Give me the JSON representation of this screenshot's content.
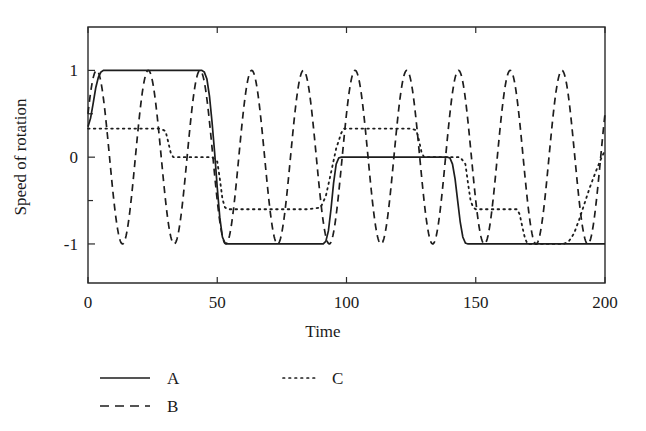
{
  "chart_data": {
    "type": "line",
    "title": "",
    "xlabel": "Time",
    "ylabel": "Speed of rotation",
    "xlim": [
      0,
      200
    ],
    "ylim": [
      -1.45,
      1.5
    ],
    "xticks": [
      0,
      50,
      100,
      150,
      200
    ],
    "xticklabels": [
      "0",
      "50",
      "100",
      "150",
      "200"
    ],
    "yticks": [
      -1,
      0,
      1
    ],
    "yticklabels": [
      "-1",
      "0",
      "1"
    ],
    "yminorticks": [
      -1.5,
      -0.5,
      0.5,
      1.5
    ],
    "grid": false,
    "frame": "box",
    "legend_position": "below-axes",
    "series": [
      {
        "name": "A",
        "style": "solid",
        "description": "smoothed square wave switching between 1, -1, 0 and -1",
        "points": [
          [
            0,
            0.35
          ],
          [
            1,
            0.45
          ],
          [
            2,
            0.62
          ],
          [
            3,
            0.8
          ],
          [
            4,
            0.92
          ],
          [
            5,
            0.98
          ],
          [
            6,
            1.0
          ],
          [
            10,
            1.0
          ],
          [
            20,
            1.0
          ],
          [
            30,
            1.0
          ],
          [
            40,
            1.0
          ],
          [
            44,
            1.0
          ],
          [
            45,
            0.98
          ],
          [
            46,
            0.9
          ],
          [
            47,
            0.7
          ],
          [
            48,
            0.4
          ],
          [
            49,
            0.05
          ],
          [
            50,
            -0.35
          ],
          [
            51,
            -0.7
          ],
          [
            52,
            -0.92
          ],
          [
            53,
            -0.99
          ],
          [
            54,
            -1.0
          ],
          [
            60,
            -1.0
          ],
          [
            70,
            -1.0
          ],
          [
            80,
            -1.0
          ],
          [
            90,
            -1.0
          ],
          [
            91,
            -1.0
          ],
          [
            92,
            -0.97
          ],
          [
            93,
            -0.85
          ],
          [
            94,
            -0.6
          ],
          [
            95,
            -0.3
          ],
          [
            96,
            -0.08
          ],
          [
            97,
            -0.01
          ],
          [
            98,
            0.0
          ],
          [
            100,
            0.0
          ],
          [
            110,
            0.0
          ],
          [
            120,
            0.0
          ],
          [
            130,
            0.0
          ],
          [
            139,
            0.0
          ],
          [
            140,
            -0.01
          ],
          [
            141,
            -0.08
          ],
          [
            142,
            -0.25
          ],
          [
            143,
            -0.5
          ],
          [
            144,
            -0.75
          ],
          [
            145,
            -0.92
          ],
          [
            146,
            -0.99
          ],
          [
            147,
            -1.0
          ],
          [
            150,
            -1.0
          ],
          [
            160,
            -1.0
          ],
          [
            170,
            -1.0
          ],
          [
            180,
            -1.0
          ],
          [
            190,
            -1.0
          ],
          [
            200,
            -1.0
          ]
        ]
      },
      {
        "name": "B",
        "style": "dashed",
        "description": "sinusoid, amplitude 1, period 20, phase rising through 0.5 at t=0",
        "amplitude": 1.0,
        "period": 20,
        "phase_at_t0": 0.5
      },
      {
        "name": "C",
        "style": "dotted",
        "description": "piecewise staircase with smooth ramps between plateaus",
        "points": [
          [
            0,
            0.33
          ],
          [
            10,
            0.33
          ],
          [
            20,
            0.33
          ],
          [
            28,
            0.33
          ],
          [
            30,
            0.3
          ],
          [
            31,
            0.18
          ],
          [
            32,
            0.05
          ],
          [
            33,
            0.0
          ],
          [
            40,
            0.0
          ],
          [
            48,
            0.0
          ],
          [
            50,
            -0.05
          ],
          [
            51,
            -0.25
          ],
          [
            52,
            -0.48
          ],
          [
            53,
            -0.58
          ],
          [
            54,
            -0.6
          ],
          [
            60,
            -0.6
          ],
          [
            70,
            -0.6
          ],
          [
            85,
            -0.6
          ],
          [
            90,
            -0.58
          ],
          [
            92,
            -0.45
          ],
          [
            94,
            -0.18
          ],
          [
            96,
            0.1
          ],
          [
            98,
            0.28
          ],
          [
            99,
            0.33
          ],
          [
            105,
            0.33
          ],
          [
            115,
            0.33
          ],
          [
            125,
            0.33
          ],
          [
            127,
            0.31
          ],
          [
            128,
            0.2
          ],
          [
            129,
            0.06
          ],
          [
            130,
            0.0
          ],
          [
            138,
            0.0
          ],
          [
            144,
            0.0
          ],
          [
            146,
            -0.08
          ],
          [
            147,
            -0.3
          ],
          [
            148,
            -0.5
          ],
          [
            149,
            -0.58
          ],
          [
            150,
            -0.6
          ],
          [
            158,
            -0.6
          ],
          [
            166,
            -0.6
          ],
          [
            167,
            -0.66
          ],
          [
            168,
            -0.8
          ],
          [
            169,
            -0.93
          ],
          [
            170,
            -1.0
          ],
          [
            176,
            -1.0
          ],
          [
            184,
            -1.0
          ],
          [
            186,
            -0.97
          ],
          [
            188,
            -0.88
          ],
          [
            190,
            -0.72
          ],
          [
            192,
            -0.54
          ],
          [
            194,
            -0.36
          ],
          [
            196,
            -0.2
          ],
          [
            198,
            -0.05
          ],
          [
            200,
            0.08
          ]
        ]
      }
    ],
    "legend": [
      {
        "label": "A",
        "style": "solid"
      },
      {
        "label": "B",
        "style": "dashed"
      },
      {
        "label": "C",
        "style": "dotted"
      }
    ],
    "colors": {
      "line": "#1d1d1d",
      "axis": "#2b2b2b",
      "background": "#ffffff",
      "text": "#1a1a1a"
    }
  }
}
